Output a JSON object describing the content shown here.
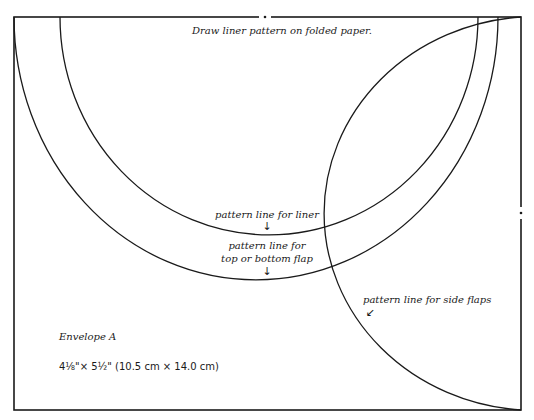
{
  "title": "Draw liner pattern on folded paper.",
  "labels": {
    "liner": "pattern line for liner",
    "flap_line1": "pattern line for",
    "flap_line2": "top or bottom flap",
    "side": "pattern line for side flaps"
  },
  "arrows": {
    "down": "↓",
    "down_left": "↙"
  },
  "envelope": {
    "name": "Envelope A",
    "size": "4⅛\"× 5½\" (10.5 cm × 14.0 cm)"
  },
  "colors": {
    "line": "#1a1a1a",
    "background": "#ffffff"
  }
}
